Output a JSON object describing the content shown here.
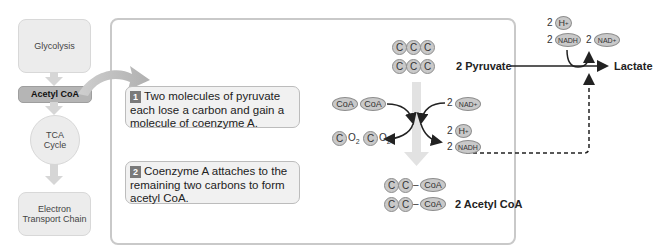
{
  "flow": {
    "glycolysis": "Glycolysis",
    "acetyl_coa": "Acetyl CoA",
    "tca_line1": "TCA",
    "tca_line2": "Cycle",
    "etc_line1": "Electron",
    "etc_line2": "Transport Chain"
  },
  "steps": [
    {
      "number": "1",
      "text": "Two molecules of pyruvate each lose a carbon and gain a molecule of coenzyme A."
    },
    {
      "number": "2",
      "text": "Coenzyme A attaches to the remaining two carbons to form acetyl CoA."
    }
  ],
  "reaction": {
    "carbon": "C",
    "coa": "CoA",
    "o2": "O",
    "o2_sub": "2",
    "coefficient": "2",
    "nad_plus": "NAD",
    "plus_sup": "+",
    "h_plus": "H",
    "nadh": "NADH",
    "pyruvate_label": "2 Pyruvate",
    "acetyl_coa_label": "2 Acetyl CoA",
    "lactate_label": "Lactate",
    "bond": "–"
  },
  "colors": {
    "molecule_fill": "#c9c9c9",
    "molecule_stroke": "#8d8d8d",
    "panel_border": "#c9c9c9",
    "step_badge": "#7a7a7a",
    "flow_active": "#b5b5b5",
    "flow_inactive": "#ececec"
  }
}
